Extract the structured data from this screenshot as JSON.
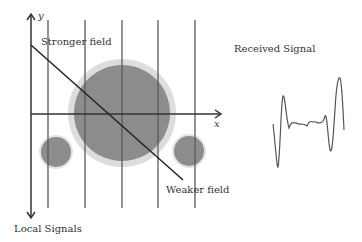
{
  "diagram": {
    "axis_labels": {
      "y": "y",
      "x": "x"
    },
    "labels": {
      "stronger_field": "Stronger field",
      "weaker_field": "Weaker field",
      "local_signals": "Local Signals",
      "received_signal": "Received Signal"
    },
    "colors": {
      "lines": "#555555",
      "circle_fill": "#8c8c8c",
      "circle_halo": "#d8d8d8",
      "signal": "#555555"
    },
    "circles": [
      {
        "name": "large-source",
        "cx": 122,
        "cy": 113,
        "r": 48
      },
      {
        "name": "left-small-source",
        "cx": 56,
        "cy": 152,
        "r": 15
      },
      {
        "name": "right-small-source",
        "cx": 189,
        "cy": 151,
        "r": 15
      }
    ],
    "vertical_lines_x": [
      48,
      85,
      122,
      158,
      195
    ]
  }
}
